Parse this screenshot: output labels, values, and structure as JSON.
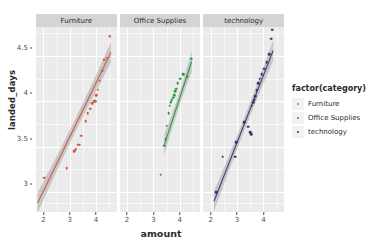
{
  "chart_data": {
    "type": "scatter",
    "title": "",
    "xlabel": "amount",
    "ylabel": "landed_days",
    "xlim": [
      1.72,
      4.78
    ],
    "ylim": [
      2.78,
      4.82
    ],
    "xticks": [
      "2",
      "3",
      "4"
    ],
    "xtick_values": [
      2,
      3,
      4
    ],
    "yticks": [
      "4.5",
      "4",
      "3.5",
      "3"
    ],
    "ytick_values": [
      4.5,
      4.0,
      3.5,
      3.0
    ],
    "grid": true,
    "legend_position": "right",
    "legend_title": "factor(category)",
    "facet_variable": "category",
    "smooth_method": "lm",
    "smooth_ribbon": "se",
    "facets": [
      {
        "label": "Furniture",
        "color": "#CF5B40",
        "x": [
          2.02,
          2.88,
          3.18,
          3.22,
          3.32,
          3.38,
          3.44,
          3.6,
          3.68,
          3.78,
          3.86,
          3.92,
          3.98,
          4.0,
          4.06,
          4.14,
          4.22,
          4.3,
          4.4,
          4.52
        ],
        "y": [
          3.16,
          3.26,
          3.45,
          3.47,
          3.52,
          3.52,
          3.62,
          3.78,
          3.87,
          3.92,
          3.98,
          4.0,
          4.0,
          4.07,
          4.13,
          4.23,
          4.34,
          4.46,
          4.48,
          4.72
        ],
        "fit": {
          "x0": 1.78,
          "y0": 2.88,
          "x1": 4.56,
          "y1": 4.54
        }
      },
      {
        "label": "Office Supplies",
        "color": "#2D9A45",
        "x": [
          3.28,
          3.4,
          3.46,
          3.5,
          3.58,
          3.62,
          3.66,
          3.7,
          3.74,
          3.78,
          3.82,
          3.86,
          3.92,
          4.02,
          4.14,
          4.28,
          4.44
        ],
        "y": [
          3.19,
          3.51,
          3.58,
          3.73,
          3.87,
          3.95,
          3.99,
          4.01,
          4.04,
          4.07,
          4.11,
          4.14,
          4.2,
          4.25,
          4.3,
          4.27,
          4.47
        ],
        "fit": {
          "x0": 3.4,
          "y0": 3.52,
          "x1": 4.44,
          "y1": 4.44
        }
      },
      {
        "label": "technology",
        "color": "#3B3370",
        "x": [
          2.2,
          2.46,
          2.92,
          2.96,
          3.28,
          3.42,
          3.5,
          3.54,
          3.56,
          3.6,
          3.64,
          3.68,
          3.74,
          3.8,
          3.86,
          3.94,
          4.02,
          4.12,
          4.22,
          4.3,
          4.34
        ],
        "y": [
          3.0,
          3.39,
          3.39,
          3.55,
          3.77,
          3.72,
          3.66,
          3.64,
          3.95,
          3.99,
          4.02,
          4.06,
          4.12,
          4.2,
          4.25,
          4.3,
          4.36,
          4.43,
          4.52,
          4.69,
          4.79
        ],
        "fit": {
          "x0": 2.14,
          "y0": 2.9,
          "x1": 4.38,
          "y1": 4.56
        }
      }
    ]
  },
  "axis": {
    "y_title": "landed_days",
    "x_title": "amount"
  },
  "legend": {
    "title": "factor(category)",
    "items": [
      {
        "label": "Furniture",
        "color": "#CF5B40"
      },
      {
        "label": "Office Supplies",
        "color": "#2D9A45"
      },
      {
        "label": "technology",
        "color": "#3B3370"
      }
    ]
  }
}
